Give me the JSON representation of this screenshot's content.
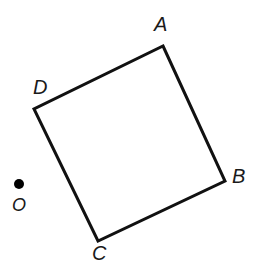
{
  "figure": {
    "kind": "plane-geometry-diagram",
    "width": 264,
    "height": 265,
    "background_color": "#ffffff",
    "stroke_color": "#111111",
    "stroke_width": 3,
    "text_color": "#1a1a1a"
  },
  "shape": {
    "name": "square-abcd",
    "closed": true,
    "vertices": [
      {
        "id": "A",
        "label": "A",
        "x": 163,
        "y": 46
      },
      {
        "id": "B",
        "label": "B",
        "x": 225,
        "y": 181
      },
      {
        "id": "C",
        "label": "C",
        "x": 98,
        "y": 241
      },
      {
        "id": "D",
        "label": "D",
        "x": 34,
        "y": 109
      }
    ],
    "path": "M 163 46 L 225 181 L 98 241 L 34 109 Z",
    "edges": [
      {
        "id": "AB",
        "from": "A",
        "to": "B"
      },
      {
        "id": "BC",
        "from": "B",
        "to": "C"
      },
      {
        "id": "CD",
        "from": "C",
        "to": "D"
      },
      {
        "id": "DA",
        "from": "D",
        "to": "A"
      }
    ]
  },
  "points": [
    {
      "id": "O",
      "label": "O",
      "x": 19,
      "y": 184,
      "radius": 5,
      "filled": true,
      "fill_color": "#000000"
    }
  ],
  "labels": {
    "a": "A",
    "b": "B",
    "c": "C",
    "d": "D",
    "o": "O"
  }
}
